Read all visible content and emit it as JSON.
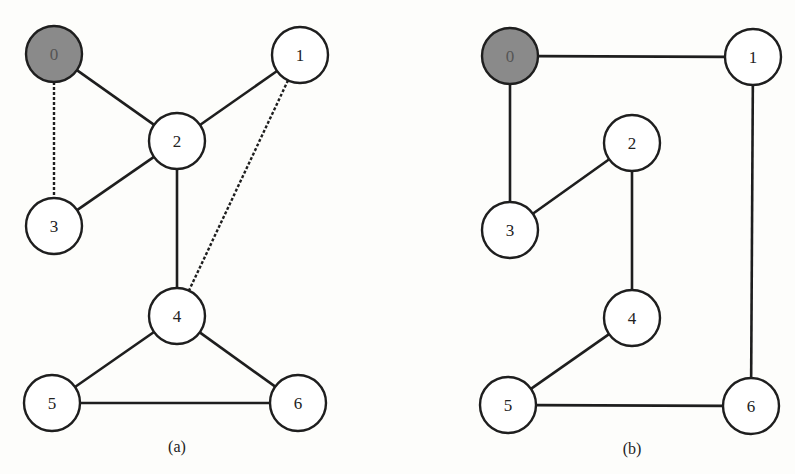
{
  "figure": {
    "panels": [
      {
        "id": "a",
        "caption": "(a)",
        "caption_pos": [
          177,
          452
        ],
        "nodes": [
          {
            "id": "0",
            "label": "0",
            "x": 54,
            "y": 54,
            "highlighted": true
          },
          {
            "id": "1",
            "label": "1",
            "x": 300,
            "y": 55,
            "highlighted": false
          },
          {
            "id": "2",
            "label": "2",
            "x": 177,
            "y": 141,
            "highlighted": false
          },
          {
            "id": "3",
            "label": "3",
            "x": 54,
            "y": 226,
            "highlighted": false
          },
          {
            "id": "4",
            "label": "4",
            "x": 177,
            "y": 316,
            "highlighted": false
          },
          {
            "id": "5",
            "label": "5",
            "x": 52,
            "y": 403,
            "highlighted": false
          },
          {
            "id": "6",
            "label": "6",
            "x": 298,
            "y": 403,
            "highlighted": false
          }
        ],
        "edges": [
          {
            "from": "0",
            "to": "2",
            "style": "solid"
          },
          {
            "from": "1",
            "to": "2",
            "style": "solid"
          },
          {
            "from": "2",
            "to": "3",
            "style": "solid"
          },
          {
            "from": "2",
            "to": "4",
            "style": "solid"
          },
          {
            "from": "4",
            "to": "5",
            "style": "solid"
          },
          {
            "from": "4",
            "to": "6",
            "style": "solid"
          },
          {
            "from": "5",
            "to": "6",
            "style": "solid"
          },
          {
            "from": "0",
            "to": "3",
            "style": "dashed"
          },
          {
            "from": "1",
            "to": "4",
            "style": "dashed"
          }
        ]
      },
      {
        "id": "b",
        "caption": "(b)",
        "caption_pos": [
          632,
          454
        ],
        "nodes": [
          {
            "id": "0",
            "label": "0",
            "x": 510,
            "y": 56,
            "highlighted": true
          },
          {
            "id": "1",
            "label": "1",
            "x": 753,
            "y": 57,
            "highlighted": false
          },
          {
            "id": "2",
            "label": "2",
            "x": 632,
            "y": 143,
            "highlighted": false
          },
          {
            "id": "3",
            "label": "3",
            "x": 510,
            "y": 230,
            "highlighted": false
          },
          {
            "id": "4",
            "label": "4",
            "x": 632,
            "y": 318,
            "highlighted": false
          },
          {
            "id": "5",
            "label": "5",
            "x": 508,
            "y": 405,
            "highlighted": false
          },
          {
            "id": "6",
            "label": "6",
            "x": 751,
            "y": 406,
            "highlighted": false
          }
        ],
        "edges": [
          {
            "from": "0",
            "to": "1",
            "style": "solid"
          },
          {
            "from": "0",
            "to": "3",
            "style": "solid"
          },
          {
            "from": "1",
            "to": "6",
            "style": "solid"
          },
          {
            "from": "2",
            "to": "3",
            "style": "solid"
          },
          {
            "from": "2",
            "to": "4",
            "style": "solid"
          },
          {
            "from": "4",
            "to": "5",
            "style": "solid"
          },
          {
            "from": "5",
            "to": "6",
            "style": "solid"
          }
        ]
      }
    ],
    "node_radius": 28,
    "colors": {
      "stroke": "#1e1e1e",
      "node_fill": "#ffffff",
      "root_fill": "#8a8a8a",
      "background": "#fdfdfb"
    }
  }
}
